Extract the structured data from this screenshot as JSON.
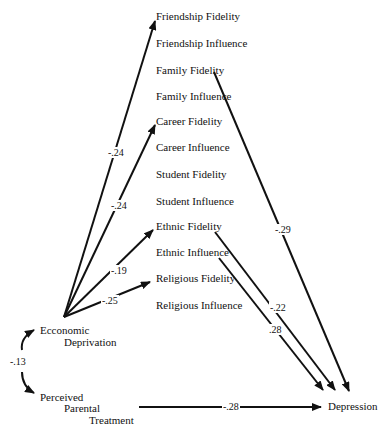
{
  "diagram": {
    "type": "path-diagram",
    "nodes": {
      "friendship_fidelity": "Friendship Fidelity",
      "friendship_influence": "Friendship Influence",
      "family_fidelity": "Family Fidelity",
      "family_influence": "Family Influence",
      "career_fidelity": "Career Fidelity",
      "career_influence": "Career Influence",
      "student_fidelity": "Student Fidelity",
      "student_influence": "Student Influence",
      "ethnic_fidelity": "Ethnic Fidelity",
      "ethnic_influence": "Ethnic Influence",
      "religious_fidelity": "Religious Fidelity",
      "religious_influence": "Religious Influence",
      "economic_line1": "Ecconomic",
      "economic_line2": "Deprivation",
      "parental_line1": "Perceived",
      "parental_line2": "Parental",
      "parental_line3": "Treatment",
      "depression": "Depression"
    },
    "paths": [
      {
        "from": "Economic Deprivation",
        "to": "Friendship Fidelity",
        "coef": "-.24"
      },
      {
        "from": "Economic Deprivation",
        "to": "Career Fidelity",
        "coef": "-.24"
      },
      {
        "from": "Economic Deprivation",
        "to": "Ethnic Fidelity",
        "coef": "-.19"
      },
      {
        "from": "Economic Deprivation",
        "to": "Religious Fidelity",
        "coef": "-.25"
      },
      {
        "from": "Family Fidelity",
        "to": "Depression",
        "coef": "-.29"
      },
      {
        "from": "Ethnic Fidelity",
        "to": "Depression",
        "coef": "-.22"
      },
      {
        "from": "Ethnic Influence",
        "to": "Depression",
        "coef": ".28"
      },
      {
        "from": "Perceived Parental Treatment",
        "to": "Depression",
        "coef": "-.28"
      },
      {
        "from": "Economic Deprivation",
        "to": "Perceived Parental Treatment",
        "coef": "-.13",
        "kind": "correlation"
      }
    ],
    "coefs": {
      "econ_friendship": "-.24",
      "econ_career": "-.24",
      "econ_ethnic": "-.19",
      "econ_religious": "-.25",
      "family_depression": "-.29",
      "ethnicfid_depression": "-.22",
      "ethnicinf_depression": ".28",
      "parental_depression": "-.28",
      "econ_parental_corr": "-.13"
    }
  }
}
